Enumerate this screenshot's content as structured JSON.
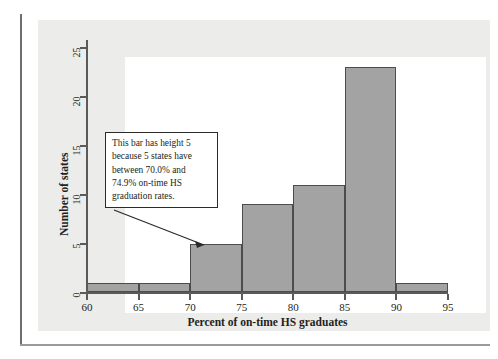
{
  "figure": {
    "background_color": "#ececeb",
    "plot_background_color": "#ffffff",
    "bar_fill_color": "#a3a3a3",
    "bar_border_color": "#4c4c4c",
    "axis_color": "#5a5a5a"
  },
  "annotation": {
    "lines": [
      "This bar has height 5",
      "because 5 states have",
      "between 70.0% and",
      "74.9% on-time HS",
      "graduation rates."
    ],
    "points_to_bin": "70-75"
  },
  "chart_data": {
    "type": "bar",
    "title": "",
    "xlabel": "Percent of on-time HS graduates",
    "ylabel": "Number of states",
    "categories": [
      "60-65",
      "65-70",
      "70-75",
      "75-80",
      "80-85",
      "85-90",
      "90-95"
    ],
    "bin_edges": [
      60,
      65,
      70,
      75,
      80,
      85,
      90,
      95
    ],
    "values": [
      1,
      1,
      5,
      9,
      11,
      23,
      1
    ],
    "xlim": [
      60,
      95
    ],
    "ylim": [
      0,
      26
    ],
    "xticks": [
      60,
      65,
      70,
      75,
      80,
      85,
      90,
      95
    ],
    "yticks": [
      0,
      5,
      10,
      15,
      20,
      25
    ],
    "xtick_labels": [
      "60",
      "65",
      "70",
      "75",
      "80",
      "85",
      "90",
      "95"
    ],
    "ytick_labels": [
      "0",
      "5",
      "10",
      "15",
      "20",
      "25"
    ],
    "grid": false,
    "legend": "none"
  }
}
